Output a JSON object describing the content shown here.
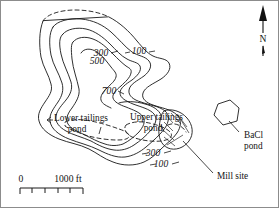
{
  "figure": {
    "kind": "contour-map",
    "background_color": "#ffffff",
    "border_color": "#8c8c8c",
    "line_color": "#171717"
  },
  "map": {
    "contour_labels": [
      {
        "text": "300",
        "x": 100,
        "y": 55
      },
      {
        "text": "100",
        "x": 138,
        "y": 53
      },
      {
        "text": "500",
        "x": 96,
        "y": 63
      },
      {
        "text": "700",
        "x": 108,
        "y": 93
      },
      {
        "text": "300",
        "x": 152,
        "y": 155
      },
      {
        "text": "100",
        "x": 160,
        "y": 166
      }
    ],
    "feature_labels": [
      {
        "name": "lower-tailings-pond",
        "line1": "Lower tailings",
        "line2": "pond",
        "x": 53,
        "y": 118
      },
      {
        "name": "upper-tailings-pond",
        "line1": "Upper tailings",
        "line2": "pond",
        "x": 129,
        "y": 116
      },
      {
        "name": "bacl-pond",
        "line1": "BaCl",
        "line2": "pond",
        "x": 243,
        "y": 137
      },
      {
        "name": "mill-site",
        "line1": "Mill site",
        "line2": "",
        "x": 218,
        "y": 177
      }
    ]
  },
  "scale_bar": {
    "zero_label": "0",
    "max_label": "1000 ft",
    "divisions": 5
  },
  "north_arrow": {
    "label": "N"
  }
}
